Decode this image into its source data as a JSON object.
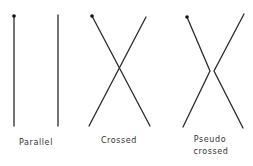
{
  "diagram": {
    "panels": [
      {
        "id": "parallel",
        "label_lines": [
          "Parallel"
        ],
        "lines": [
          {
            "points": [
              [
                14,
                16
              ],
              [
                14,
                126
              ]
            ],
            "start_dot": true
          },
          {
            "points": [
              [
                58,
                15
              ],
              [
                58,
                126
              ]
            ],
            "start_dot": false
          }
        ],
        "label_x": 36,
        "label_y": [
          145
        ]
      },
      {
        "id": "crossed",
        "label_lines": [
          "Crossed"
        ],
        "lines": [
          {
            "points": [
              [
                92,
                16
              ],
              [
                150,
                126
              ]
            ],
            "start_dot": true
          },
          {
            "points": [
              [
                146,
                17
              ],
              [
                89,
                126
              ]
            ],
            "start_dot": false
          }
        ],
        "label_x": 119,
        "label_y": [
          143
        ]
      },
      {
        "id": "pseudo-crossed",
        "label_lines": [
          "Pseudo",
          "crossed"
        ],
        "lines": [
          {
            "points": [
              [
                187,
                17
              ],
              [
                210,
                71
              ],
              [
                183,
                127
              ]
            ],
            "start_dot": true
          },
          {
            "points": [
              [
                244,
                14
              ],
              [
                214,
                71
              ],
              [
                243,
                128
              ]
            ],
            "start_dot": false
          }
        ],
        "label_x": 210,
        "label_y": [
          142,
          154
        ]
      }
    ],
    "colors": {
      "line": "#2a2a2a",
      "text": "#333333",
      "background": "#ffffff"
    }
  }
}
